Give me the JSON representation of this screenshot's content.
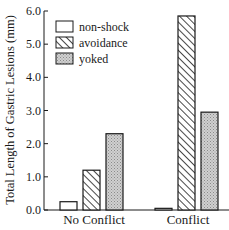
{
  "chart_data": {
    "type": "bar",
    "title": "",
    "xlabel": "",
    "ylabel": "Total Length of Gastric Lesions (mm)",
    "ylim": [
      0,
      6
    ],
    "yticks": [
      "0.0",
      "1.0",
      "2.0",
      "3.0",
      "4.0",
      "5.0",
      "6.0"
    ],
    "grid": false,
    "legend_position": "upper-left",
    "categories": [
      "No Conflict",
      "Conflict"
    ],
    "series": [
      {
        "name": "non-shock",
        "pattern": "empty",
        "values": [
          0.25,
          0.05
        ]
      },
      {
        "name": "avoidance",
        "pattern": "diagonal-hatch",
        "values": [
          1.2,
          5.85
        ]
      },
      {
        "name": "yoked",
        "pattern": "stipple-gray",
        "values": [
          2.3,
          2.95
        ]
      }
    ]
  },
  "colors": {
    "axis": "#1a1a1a",
    "stipple_fill": "#c8c8c8",
    "hatch": "#1a1a1a",
    "background": "#ffffff"
  }
}
